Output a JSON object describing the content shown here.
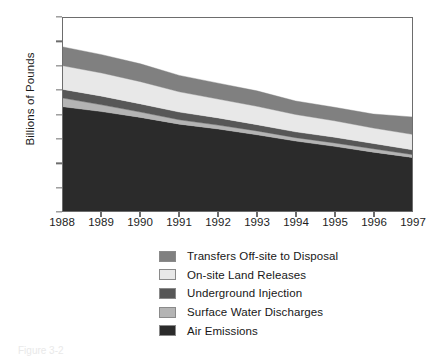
{
  "figure": {
    "caption": "Figure 3-2"
  },
  "axes": {
    "ylabel": "Billions of Pounds",
    "yticks": [
      "0.0",
      "0.5",
      "1.0",
      "1.5",
      "2.0",
      "2.5",
      "3.0",
      "3.5",
      "4.0"
    ],
    "ylim": [
      0,
      4
    ],
    "xticks": [
      "1988",
      "1989",
      "1990",
      "1991",
      "1992",
      "1993",
      "1994",
      "1995",
      "1996",
      "1997"
    ]
  },
  "legend": {
    "items": [
      {
        "label": "Transfers Off-site to Disposal",
        "color": "#808080"
      },
      {
        "label": "On-site Land Releases",
        "color": "#e8e8e8"
      },
      {
        "label": "Underground Injection",
        "color": "#575757"
      },
      {
        "label": "Surface Water Discharges",
        "color": "#b4b4b4"
      },
      {
        "label": "Air Emissions",
        "color": "#2b2b2b"
      }
    ]
  },
  "chart_data": {
    "type": "area",
    "stacked": true,
    "title": "",
    "xlabel": "",
    "ylabel": "Billions of Pounds",
    "ylim": [
      0,
      4
    ],
    "grid": false,
    "legend_position": "below",
    "categories": [
      "1988",
      "1989",
      "1990",
      "1991",
      "1992",
      "1993",
      "1994",
      "1995",
      "1996",
      "1997"
    ],
    "series": [
      {
        "name": "Air Emissions",
        "color": "#2b2b2b",
        "values": [
          2.16,
          2.06,
          1.94,
          1.8,
          1.7,
          1.58,
          1.45,
          1.34,
          1.22,
          1.11
        ]
      },
      {
        "name": "Surface Water Discharges",
        "color": "#b4b4b4",
        "values": [
          0.18,
          0.14,
          0.11,
          0.09,
          0.08,
          0.08,
          0.07,
          0.07,
          0.07,
          0.06
        ]
      },
      {
        "name": "Underground Injection",
        "color": "#575757",
        "values": [
          0.18,
          0.18,
          0.17,
          0.16,
          0.15,
          0.13,
          0.12,
          0.12,
          0.11,
          0.1
        ]
      },
      {
        "name": "On-site Land Releases",
        "color": "#e8e8e8",
        "values": [
          0.49,
          0.48,
          0.46,
          0.42,
          0.39,
          0.38,
          0.36,
          0.34,
          0.32,
          0.32
        ]
      },
      {
        "name": "Transfers Off-site to Disposal",
        "color": "#808080",
        "values": [
          0.39,
          0.38,
          0.37,
          0.34,
          0.33,
          0.32,
          0.28,
          0.28,
          0.29,
          0.36
        ]
      }
    ],
    "totals": [
      3.4,
      3.24,
      3.05,
      2.81,
      2.65,
      2.49,
      2.28,
      2.15,
      2.01,
      1.95
    ]
  }
}
